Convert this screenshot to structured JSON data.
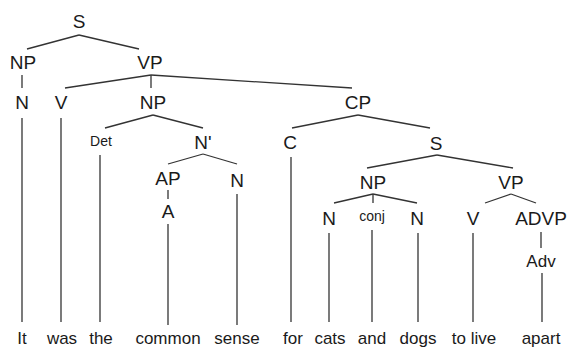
{
  "diagram": {
    "type": "syntax-tree",
    "sentence": [
      "It",
      "was",
      "the",
      "common",
      "sense",
      "for",
      "cats",
      "and",
      "dogs",
      "to live",
      "apart"
    ],
    "nodes": {
      "s_root": "S",
      "np_subj": "NP",
      "vp_main": "VP",
      "n_it": "N",
      "v_was": "V",
      "np_obj": "NP",
      "cp": "CP",
      "det": "Det",
      "nbar": "N'",
      "c": "C",
      "s_emb": "S",
      "ap": "AP",
      "n_sense": "N",
      "a": "A",
      "np_emb": "NP",
      "vp_emb": "VP",
      "n_cats": "N",
      "conj": "conj",
      "n_dogs": "N",
      "v_live": "V",
      "advp": "ADVP",
      "adv": "Adv"
    },
    "words": {
      "w0": "It",
      "w1": "was",
      "w2": "the",
      "w3": "common",
      "w4": "sense",
      "w5": "for",
      "w6": "cats",
      "w7": "and",
      "w8": "dogs",
      "w9": "to live",
      "w10": "apart"
    }
  }
}
